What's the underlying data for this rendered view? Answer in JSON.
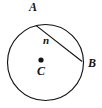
{
  "figure": {
    "kind": "circle-geometry-diagram",
    "background_color": "#ffffff",
    "stroke_color": "#131313",
    "labels": {
      "point_a": "A",
      "point_b": "B",
      "center_c": "C",
      "chord_n": "n"
    },
    "geometry": {
      "circle": {
        "cx": 45.5,
        "cy": 62.5,
        "r": 38
      },
      "center_dot": {
        "cx": 41,
        "cy": 60,
        "r": 2.6
      },
      "chord": {
        "x1": 36.2,
        "y1": 25.6,
        "x2": 81.8,
        "y2": 61.2
      }
    }
  }
}
